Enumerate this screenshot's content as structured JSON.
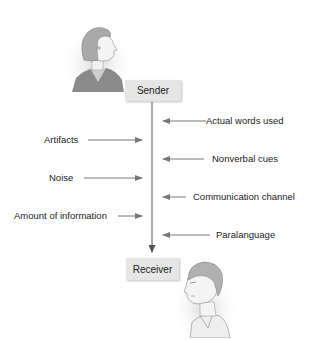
{
  "diagram": {
    "type": "communication-process",
    "sender": {
      "label": "Sender",
      "figure": "woman-profile-illustration"
    },
    "receiver": {
      "label": "Receiver",
      "figure": "man-profile-illustration"
    },
    "right_factors": [
      {
        "label": "Actual words used"
      },
      {
        "label": "Nonverbal cues"
      },
      {
        "label": "Communication channel"
      },
      {
        "label": "Paralanguage"
      }
    ],
    "left_factors": [
      {
        "label": "Artifacts"
      },
      {
        "label": "Noise"
      },
      {
        "label": "Amount of information"
      }
    ],
    "colors": {
      "box_fill": "#e6e6e6",
      "line": "#555555",
      "arrow": "#777777",
      "text": "#222222"
    }
  }
}
